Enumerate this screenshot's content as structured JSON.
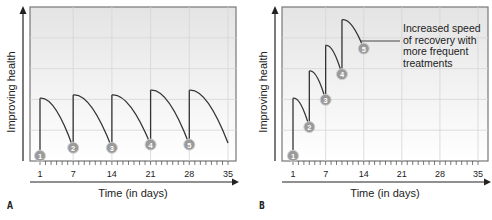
{
  "chart_data": [
    {
      "panel": "A",
      "type": "line",
      "title": "",
      "xlabel": "Time (in days)",
      "ylabel": "Improving health",
      "x_ticks": [
        "1",
        "7",
        "14",
        "21",
        "28",
        "35"
      ],
      "xlim": [
        1,
        35
      ],
      "grid": true,
      "treatments": [
        {
          "label": "1",
          "day": 1,
          "start": 0.1,
          "peak": 1.9
        },
        {
          "label": "2",
          "day": 7,
          "start": 0.35,
          "peak": 2.0
        },
        {
          "label": "3",
          "day": 14,
          "start": 0.35,
          "peak": 2.0
        },
        {
          "label": "4",
          "day": 21,
          "start": 0.45,
          "peak": 2.15
        },
        {
          "label": "5",
          "day": 28,
          "start": 0.45,
          "peak": 2.15
        }
      ],
      "end": {
        "day": 35,
        "value": 0.5
      },
      "annotation": ""
    },
    {
      "panel": "B",
      "type": "line",
      "title": "",
      "xlabel": "Time (in days)",
      "ylabel": "Improving health",
      "x_ticks": [
        "1",
        "7",
        "14",
        "21",
        "28",
        "35"
      ],
      "xlim": [
        1,
        35
      ],
      "grid": true,
      "treatments": [
        {
          "label": "1",
          "day": 1,
          "start": 0.1,
          "peak": 1.9
        },
        {
          "label": "2",
          "day": 4,
          "start": 1.0,
          "peak": 2.75
        },
        {
          "label": "3",
          "day": 7,
          "start": 1.85,
          "peak": 3.55
        },
        {
          "label": "4",
          "day": 10,
          "start": 2.65,
          "peak": 4.35
        }
      ],
      "end": {
        "label": "5",
        "day": 14,
        "value": 3.45
      },
      "annotation": "Increased speed of recovery with more frequent treatments"
    }
  ],
  "panels": {
    "A": {
      "letter": "A",
      "xlabel": "Time (in days)",
      "ylabel": "Improving health"
    },
    "B": {
      "letter": "B",
      "xlabel": "Time (in days)",
      "ylabel": "Improving health",
      "annotation_lines": [
        "Increased speed",
        "of recovery with",
        "more frequent",
        "treatments"
      ]
    }
  }
}
